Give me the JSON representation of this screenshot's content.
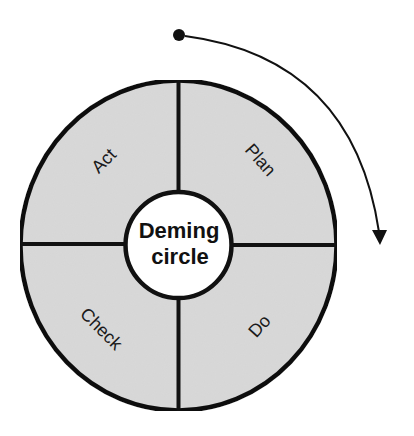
{
  "diagram": {
    "title": "Deming circle",
    "center_label_line1": "Deming",
    "center_label_line2": "circle",
    "quadrants": [
      {
        "position": "top-right",
        "label": "Plan"
      },
      {
        "position": "bottom-right",
        "label": "Do"
      },
      {
        "position": "bottom-left",
        "label": "Check"
      },
      {
        "position": "top-left",
        "label": "Act"
      }
    ],
    "direction": "clockwise",
    "colors": {
      "fill": "#d9d9d9",
      "stroke": "#111111",
      "center_fill": "#ffffff",
      "background": "#ffffff"
    }
  }
}
